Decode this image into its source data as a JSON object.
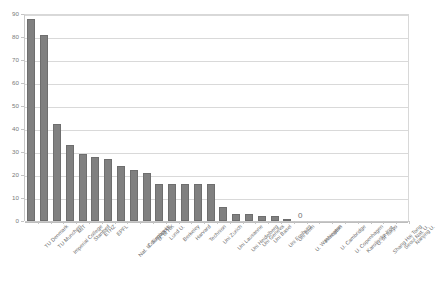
{
  "chart_data": {
    "type": "bar",
    "title": "",
    "subtitle": "",
    "xlabel": "",
    "ylabel": "",
    "ylim": [
      0,
      90
    ],
    "grid": true,
    "legend": null,
    "bar_color": "#808080",
    "y_ticks": [
      0,
      10,
      20,
      30,
      40,
      50,
      60,
      70,
      80,
      90
    ],
    "y_tick_labels": [
      "0",
      "10",
      "20",
      "30",
      "40",
      "50",
      "60",
      "70",
      "80",
      "90"
    ],
    "annotations": [
      {
        "text": "0",
        "category": "U. Washington"
      }
    ],
    "categories": [
      "TU Denmark",
      "TU Munchen",
      "Imperial College",
      "MIT",
      "Stanford",
      "ETHZ",
      "EPFL",
      "Nat. U. Singapore",
      "Columbia U.",
      "U. of HK",
      "Lund U.",
      "Berkeley",
      "Harvard",
      "Technion",
      "Uni Zurich",
      "Uni Lausanne",
      "Uni Heidelberg",
      "Uni Geneva",
      "Uni Basel",
      "Uni Freiburg",
      "Uni Bern",
      "U. Washington",
      "Princeton",
      "U. Cambridge",
      "U. Copenhagen",
      "Karolinska Inst.",
      "U. of Tokyo",
      "Shang Hai Tong",
      "Seoul Nat. U.",
      "Nanjing U."
    ],
    "values": [
      88,
      81,
      42,
      33,
      29,
      28,
      27,
      24,
      22,
      21,
      16,
      16,
      16,
      16,
      16,
      6,
      3,
      3,
      2,
      2,
      1,
      0,
      0,
      0,
      0,
      0,
      0,
      0,
      0,
      0
    ]
  }
}
